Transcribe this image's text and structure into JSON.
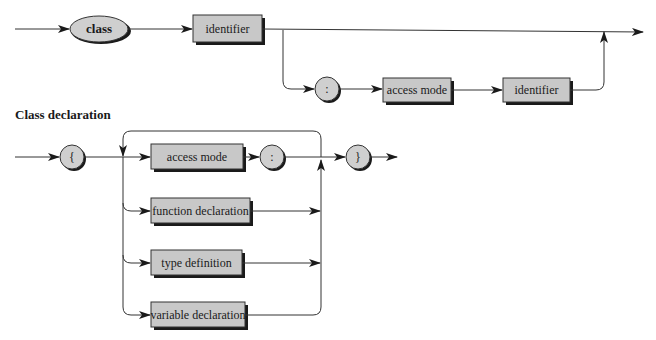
{
  "diagram": {
    "type": "syntax-diagram",
    "colors": {
      "box_fill": "#c8c8c8",
      "terminal_fill": "#cfcfcf",
      "line": "#333333",
      "shadow": "#1a1a1a"
    },
    "class_header": {
      "keyword": "class",
      "identifier": "identifier",
      "colon": ":",
      "access_mode": "access mode",
      "base_identifier": "identifier"
    },
    "class_declaration": {
      "title": "Class declaration",
      "open_brace": "{",
      "close_brace": "}",
      "colon": ":",
      "members": [
        {
          "label": "access mode"
        },
        {
          "label": "function declaration"
        },
        {
          "label": "type definition"
        },
        {
          "label": "variable declaration"
        }
      ]
    }
  }
}
